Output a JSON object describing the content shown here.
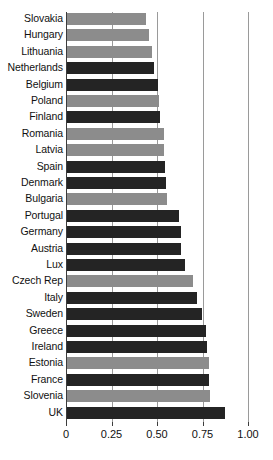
{
  "chart_data": {
    "type": "bar",
    "orientation": "horizontal",
    "title": "",
    "subtitle": "",
    "xlabel": "",
    "ylabel": "",
    "xlim": [
      0,
      1.0
    ],
    "xticks": [
      0,
      0.25,
      0.5,
      0.75,
      1.0
    ],
    "xtick_labels": [
      "0",
      "0.25",
      "0.50",
      "0.75",
      "1.00"
    ],
    "grid": true,
    "gridlines_at": [
      0.25,
      0.5,
      0.75,
      1.0
    ],
    "legend": "none",
    "legend_position": "none",
    "colors": {
      "gray": "#8c8c8c",
      "dark": "#242424",
      "axis": "#3c3c3c",
      "gridline": "#9a9a9a",
      "background": "#ffffff",
      "text": "#111111"
    },
    "categories": [
      "Slovakia",
      "Hungary",
      "Lithuania",
      "Netherlands",
      "Belgium",
      "Poland",
      "Finland",
      "Romania",
      "Latvia",
      "Spain",
      "Denmark",
      "Bulgaria",
      "Portugal",
      "Germany",
      "Austria",
      "Lux",
      "Czech Rep",
      "Italy",
      "Sweden",
      "Greece",
      "Ireland",
      "Estonia",
      "France",
      "Slovenia",
      "UK"
    ],
    "values": [
      0.435,
      0.451,
      0.467,
      0.478,
      0.5,
      0.506,
      0.511,
      0.533,
      0.533,
      0.539,
      0.544,
      0.55,
      0.616,
      0.627,
      0.627,
      0.649,
      0.692,
      0.714,
      0.742,
      0.764,
      0.77,
      0.78,
      0.78,
      0.786,
      0.868
    ],
    "series": [
      {
        "name": "value",
        "values": [
          0.435,
          0.451,
          0.467,
          0.478,
          0.5,
          0.506,
          0.511,
          0.533,
          0.533,
          0.539,
          0.544,
          0.55,
          0.616,
          0.627,
          0.627,
          0.649,
          0.692,
          0.714,
          0.742,
          0.764,
          0.77,
          0.78,
          0.78,
          0.786,
          0.868
        ]
      }
    ],
    "bar_colors": [
      "gray",
      "gray",
      "gray",
      "dark",
      "dark",
      "gray",
      "dark",
      "gray",
      "gray",
      "dark",
      "dark",
      "gray",
      "dark",
      "dark",
      "dark",
      "dark",
      "gray",
      "dark",
      "dark",
      "dark",
      "dark",
      "gray",
      "dark",
      "gray",
      "dark"
    ]
  }
}
